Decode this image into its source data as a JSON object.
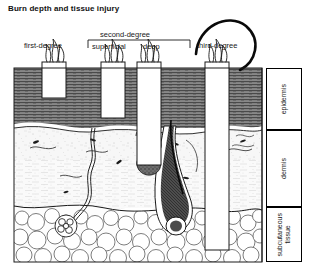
{
  "figure": {
    "title": "Burn depth and tissue injury",
    "caption_labels": {
      "first_degree": "first-degree",
      "second_degree": "second-degree",
      "superficial": "superficial",
      "deep": "deep",
      "third_degree": "third-degree"
    },
    "layers": [
      {
        "name": "epidermis",
        "label": "epidermis",
        "top": 68,
        "bottom": 130
      },
      {
        "name": "dermis",
        "label": "dermis",
        "top": 130,
        "bottom": 207
      },
      {
        "name": "subcutaneous",
        "label": "subcutaneous\ntissue",
        "top": 207,
        "bottom": 262
      }
    ],
    "burn_columns": [
      {
        "name": "first-degree",
        "x": 42,
        "width": 24,
        "depth_bottom": 98,
        "label": "first-degree"
      },
      {
        "name": "superficial-second-degree",
        "x": 101,
        "width": 24,
        "depth_bottom": 118,
        "label": "superficial"
      },
      {
        "name": "deep-second-degree",
        "x": 137,
        "width": 24,
        "depth_bottom": 165,
        "label": "deep"
      },
      {
        "name": "third-degree",
        "x": 205,
        "width": 24,
        "depth_bottom": 250,
        "label": "third-degree"
      }
    ],
    "structures": [
      "flames",
      "epidermis-hatching",
      "dermis-stipple",
      "hair-follicle",
      "sebaceous-gland",
      "sweat-gland",
      "capillary",
      "fat-cells"
    ],
    "colors": {
      "ink": "#000000",
      "epidermis_fill": "#5a5a5a",
      "dermis_fill": "#f2f2f2",
      "subcutaneous_fill": "#fbfbfb",
      "burn_column_fill": "#ffffff",
      "background": "#ffffff"
    }
  }
}
